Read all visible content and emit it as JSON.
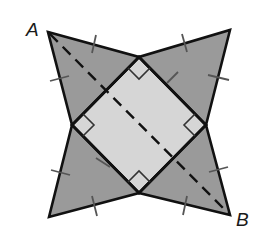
{
  "diagram": {
    "type": "geometry-figure",
    "labels": {
      "A": "A",
      "B": "B"
    },
    "colors": {
      "outline": "#111111",
      "triangle_fill": "#9a9a9a",
      "square_fill": "#d6d6d6",
      "tick_marks": "#555555",
      "dashed_line": "#111111",
      "background": "#ffffff"
    },
    "points": {
      "A": [
        48,
        32
      ],
      "top_right_tip": [
        230,
        30
      ],
      "bottom_left_tip": [
        49,
        217
      ],
      "B": [
        230,
        215
      ],
      "square_top": [
        139,
        57
      ],
      "square_right": [
        206,
        125
      ],
      "square_bottom": [
        139,
        193
      ],
      "square_left": [
        72,
        125
      ]
    },
    "features": {
      "right_angle_markers": 4,
      "equal_length_tick_marks": 8,
      "dashed_segment": "A to B"
    }
  }
}
